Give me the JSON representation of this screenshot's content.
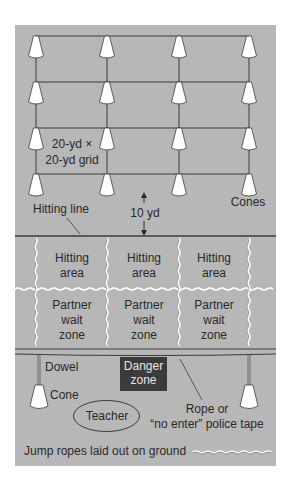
{
  "colors": {
    "page_bg": "#ffffff",
    "field_bg": "#b7b7b7",
    "zone_bg": "#bcbcbc",
    "line": "#3c3c3c",
    "cone_fill": "#ffffff",
    "danger_bg": "#3b3b3b",
    "danger_text": "#e6e6e6"
  },
  "grid": {
    "label_line1": "20-yd ×",
    "label_line2": "20-yd grid",
    "cones_label": "Cones",
    "columns": 4,
    "rows": 4
  },
  "distance": {
    "label": "10 yd"
  },
  "hitting_line": {
    "label": "Hitting line"
  },
  "hitting_areas": [
    {
      "line1": "Hitting",
      "line2": "area"
    },
    {
      "line1": "Hitting",
      "line2": "area"
    },
    {
      "line1": "Hitting",
      "line2": "area"
    }
  ],
  "wait_zones": [
    {
      "line1": "Partner",
      "line2": "wait",
      "line3": "zone"
    },
    {
      "line1": "Partner",
      "line2": "wait",
      "line3": "zone"
    },
    {
      "line1": "Partner",
      "line2": "wait",
      "line3": "zone"
    }
  ],
  "barrier": {
    "dowel_label": "Dowel",
    "cone_label": "Cone",
    "danger_line1": "Danger",
    "danger_line2": "zone",
    "rope_line1": "Rope or",
    "rope_line2": "“no enter” police tape"
  },
  "teacher": {
    "label": "Teacher"
  },
  "legend": {
    "jump_ropes_label": "Jump ropes laid out on ground"
  }
}
